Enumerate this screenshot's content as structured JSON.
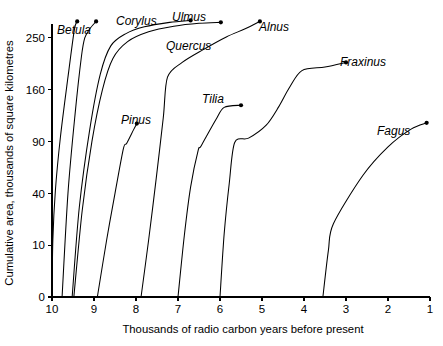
{
  "chart_data": {
    "type": "line",
    "title": "",
    "xlabel": "Thousands of radio carbon years before present",
    "ylabel": "Cumulative area, thousands of square kilometres",
    "x_ticks": [
      10,
      9,
      8,
      7,
      6,
      5,
      4,
      3,
      2,
      1
    ],
    "y_ticks": [
      0,
      10,
      40,
      90,
      160,
      250
    ],
    "xlim": [
      10,
      1
    ],
    "ylim": [
      0,
      290
    ],
    "x_axis_reversed": true,
    "y_scale": "sqrt",
    "grid": false,
    "legend": "inline-labels",
    "series": [
      {
        "name": "Betula",
        "label": "Betula",
        "label_x": 57,
        "label_y": 34,
        "endpoint_marker": true,
        "points": [
          [
            10.0,
            0
          ],
          [
            9.98,
            12
          ],
          [
            9.92,
            42
          ],
          [
            9.8,
            95
          ],
          [
            9.62,
            180
          ],
          [
            9.47,
            265
          ],
          [
            9.4,
            283
          ]
        ]
      },
      {
        "name": "Corylus",
        "label": "Corylus",
        "label_x": 116,
        "label_y": 25,
        "endpoint_marker": true,
        "points": [
          [
            9.76,
            0
          ],
          [
            9.62,
            40
          ],
          [
            9.45,
            125
          ],
          [
            9.3,
            215
          ],
          [
            9.22,
            250
          ],
          [
            9.1,
            268
          ],
          [
            8.95,
            283
          ]
        ]
      },
      {
        "name": "Ulmus",
        "label": "Ulmus",
        "label_x": 172,
        "label_y": 21,
        "endpoint_marker": true,
        "points": [
          [
            9.52,
            0
          ],
          [
            9.35,
            30
          ],
          [
            9.1,
            105
          ],
          [
            8.85,
            185
          ],
          [
            8.6,
            235
          ],
          [
            8.25,
            258
          ],
          [
            7.8,
            272
          ],
          [
            7.2,
            281
          ],
          [
            6.7,
            285
          ]
        ]
      },
      {
        "name": "Quercus",
        "label": "Quercus",
        "label_x": 166,
        "label_y": 50,
        "endpoint_marker": true,
        "points": [
          [
            9.48,
            0
          ],
          [
            9.28,
            28
          ],
          [
            9.05,
            90
          ],
          [
            8.8,
            160
          ],
          [
            8.55,
            212
          ],
          [
            8.2,
            243
          ],
          [
            7.7,
            262
          ],
          [
            7.1,
            273
          ],
          [
            6.5,
            279
          ],
          [
            5.98,
            281
          ]
        ]
      },
      {
        "name": "Pinus",
        "label": "Pinus",
        "label_x": 121,
        "label_y": 124,
        "endpoint_marker": true,
        "points": [
          [
            8.92,
            0
          ],
          [
            8.7,
            12
          ],
          [
            8.5,
            40
          ],
          [
            8.3,
            82
          ],
          [
            8.22,
            88
          ],
          [
            8.05,
            105
          ],
          [
            7.98,
            112
          ]
        ]
      },
      {
        "name": "Alnus",
        "label": "Alnus",
        "label_x": 259,
        "label_y": 31,
        "endpoint_marker": true,
        "points": [
          [
            7.88,
            0
          ],
          [
            7.7,
            12
          ],
          [
            7.52,
            52
          ],
          [
            7.35,
            120
          ],
          [
            7.25,
            180
          ],
          [
            6.9,
            205
          ],
          [
            6.4,
            228
          ],
          [
            5.85,
            252
          ],
          [
            5.4,
            268
          ],
          [
            5.05,
            283
          ]
        ]
      },
      {
        "name": "Tilia",
        "label": "Tilia",
        "label_x": 202,
        "label_y": 103,
        "endpoint_marker": true,
        "points": [
          [
            7.0,
            0
          ],
          [
            6.85,
            14
          ],
          [
            6.7,
            45
          ],
          [
            6.52,
            80
          ],
          [
            6.45,
            85
          ],
          [
            6.1,
            117
          ],
          [
            5.9,
            134
          ],
          [
            5.5,
            137
          ]
        ]
      },
      {
        "name": "Fraxinus",
        "label": "Fraxinus",
        "label_x": 340,
        "label_y": 66,
        "endpoint_marker": true,
        "points": [
          [
            6.0,
            0
          ],
          [
            5.9,
            15
          ],
          [
            5.78,
            48
          ],
          [
            5.65,
            89
          ],
          [
            5.32,
            94
          ],
          [
            4.9,
            110
          ],
          [
            4.6,
            135
          ],
          [
            4.35,
            163
          ],
          [
            4.05,
            191
          ],
          [
            3.5,
            197
          ],
          [
            3.0,
            205
          ]
        ]
      },
      {
        "name": "Fagus",
        "label": "Fagus",
        "label_x": 377,
        "label_y": 135,
        "endpoint_marker": true,
        "points": [
          [
            3.55,
            0
          ],
          [
            3.42,
            8
          ],
          [
            3.3,
            20
          ],
          [
            2.6,
            55
          ],
          [
            2.0,
            84
          ],
          [
            1.45,
            105
          ],
          [
            1.08,
            113
          ]
        ]
      }
    ]
  }
}
